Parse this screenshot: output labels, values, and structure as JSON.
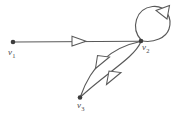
{
  "figure": {
    "type": "directed-graph-diagram",
    "background_color": "#ffffff",
    "stroke_color": "#595959",
    "node_fill_color": "#3d3d3d",
    "label_color": "#4a4a4a"
  },
  "nodes": [
    {
      "id": "v1",
      "name": "v",
      "subscript": "1",
      "x": 13,
      "y": 42
    },
    {
      "id": "v2",
      "name": "v",
      "subscript": "2",
      "x": 141,
      "y": 41
    },
    {
      "id": "v3",
      "name": "v",
      "subscript": "3",
      "x": 80,
      "y": 98
    }
  ],
  "edges": [
    {
      "id": "e-v1-v2",
      "from": "v1",
      "to": "v2",
      "shape": "straight",
      "arrow_direction": "right",
      "arrow_position": {
        "x": 78,
        "y": 41
      }
    },
    {
      "id": "e-v2-v2-loop",
      "from": "v2",
      "to": "v2",
      "shape": "self-loop",
      "arrow_direction": "left",
      "arrow_position": {
        "x": 162,
        "y": 11
      }
    },
    {
      "id": "e-v2-v3-upper",
      "from": "v2",
      "to": "v3",
      "shape": "curve-upper-left",
      "arrow_direction": "down-left",
      "arrow_position": {
        "x": 102,
        "y": 62
      }
    },
    {
      "id": "e-v2-v3-lower",
      "from": "v2",
      "to": "v3",
      "shape": "curve-lower-right",
      "arrow_direction": "down-left",
      "arrow_position": {
        "x": 113,
        "y": 78
      }
    }
  ]
}
